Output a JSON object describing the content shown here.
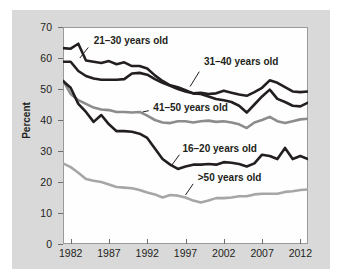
{
  "chart_data": {
    "type": "line",
    "title": "",
    "xlabel": "",
    "ylabel": "Percent",
    "xlim": [
      1981,
      2013
    ],
    "ylim": [
      0,
      70
    ],
    "ytick_labels": [
      "0",
      "10",
      "20",
      "30",
      "40",
      "50",
      "60",
      "70"
    ],
    "ytick_values": [
      0,
      10,
      20,
      30,
      40,
      50,
      60,
      70
    ],
    "xtick_labels": [
      "1982",
      "1987",
      "1992",
      "1997",
      "2002",
      "2007",
      "2012"
    ],
    "xtick_values": [
      1982,
      1987,
      1992,
      1997,
      2002,
      2007,
      2012
    ],
    "grid": false,
    "legend": "inline-annotations",
    "x": [
      1981,
      1982,
      1983,
      1984,
      1985,
      1986,
      1987,
      1988,
      1989,
      1990,
      1991,
      1992,
      1993,
      1994,
      1995,
      1996,
      1997,
      1998,
      1999,
      2000,
      2001,
      2002,
      2003,
      2004,
      2005,
      2006,
      2007,
      2008,
      2009,
      2010,
      2011,
      2012,
      2013
    ],
    "series": [
      {
        "name": "21-30 years old",
        "color": "#231f20",
        "width": 2.6,
        "label_x": 1985.0,
        "label_y": 65.5,
        "leader_from": [
          1984.3,
          63.4
        ],
        "leader_to": [
          1983.2,
          60.0
        ],
        "values": [
          63.2,
          63.0,
          64.6,
          59.2,
          58.8,
          58.4,
          59.0,
          58.0,
          58.6,
          57.4,
          57.4,
          56.6,
          54.4,
          52.6,
          51.2,
          50.6,
          49.6,
          48.6,
          48.8,
          48.4,
          48.6,
          49.4,
          48.8,
          48.2,
          47.8,
          49.0,
          50.4,
          52.8,
          52.0,
          50.6,
          49.2,
          49.0,
          49.2
        ]
      },
      {
        "name": "31-40 years old",
        "color": "#231f20",
        "width": 2.6,
        "label_x": 1999.4,
        "label_y": 58.6,
        "leader_from": [
          1998.8,
          55.6
        ],
        "leader_to": [
          1997.6,
          50.8
        ],
        "values": [
          58.8,
          58.8,
          55.8,
          54.2,
          53.4,
          53.0,
          53.0,
          53.0,
          53.2,
          55.0,
          55.2,
          54.6,
          53.2,
          52.0,
          51.0,
          50.0,
          49.2,
          48.6,
          48.4,
          47.6,
          46.8,
          46.4,
          45.8,
          44.6,
          42.4,
          45.0,
          47.6,
          49.8,
          46.8,
          45.8,
          44.6,
          44.4,
          45.6
        ]
      },
      {
        "name": "41-50 years old",
        "color": "#8c8c8c",
        "width": 2.6,
        "label_x": 1992.8,
        "label_y": 44.0,
        "leader_from": [
          1992.2,
          43.0
        ],
        "leader_to": [
          1991.4,
          42.6
        ],
        "values": [
          52.8,
          48.4,
          46.4,
          45.2,
          44.0,
          43.4,
          43.2,
          42.6,
          42.6,
          42.4,
          42.6,
          41.4,
          40.0,
          39.2,
          39.0,
          39.6,
          39.6,
          39.2,
          39.6,
          39.8,
          39.4,
          39.6,
          39.2,
          38.6,
          37.4,
          39.2,
          40.0,
          41.0,
          39.6,
          39.0,
          39.6,
          40.2,
          40.4
        ]
      },
      {
        "name": "16-20 years old",
        "color": "#231f20",
        "width": 2.6,
        "label_x": 1996.6,
        "label_y": 30.8,
        "leader_from": [
          1996.2,
          28.8
        ],
        "leader_to": [
          1995.2,
          25.4
        ],
        "values": [
          52.6,
          50.4,
          45.2,
          42.6,
          39.4,
          41.6,
          38.6,
          36.4,
          36.4,
          36.2,
          35.6,
          34.2,
          30.8,
          27.4,
          25.6,
          24.2,
          25.0,
          25.6,
          25.6,
          25.8,
          25.6,
          26.4,
          26.2,
          25.8,
          25.0,
          26.0,
          28.8,
          28.4,
          27.4,
          31.0,
          27.4,
          28.4,
          27.4
        ]
      },
      {
        "name": ">50 years old",
        "color": "#a6a6a6",
        "width": 2.6,
        "label_x": 1998.6,
        "label_y": 21.2,
        "leader_from": [
          1998.0,
          19.4
        ],
        "leader_to": [
          1997.0,
          15.8
        ],
        "values": [
          26.0,
          24.8,
          23.0,
          21.0,
          20.4,
          20.0,
          19.2,
          18.4,
          18.2,
          18.0,
          17.4,
          16.6,
          16.0,
          15.0,
          15.8,
          15.6,
          15.0,
          14.0,
          13.4,
          14.0,
          14.8,
          14.8,
          15.0,
          15.4,
          15.4,
          16.0,
          16.2,
          16.2,
          16.2,
          16.8,
          17.0,
          17.4,
          17.6
        ]
      }
    ]
  }
}
